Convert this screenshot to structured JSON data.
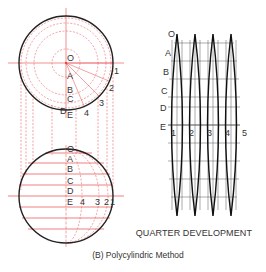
{
  "figure": {
    "caption": "(B) Polycylindric Method",
    "development_caption": "QUARTER DEVELOPMENT",
    "colors": {
      "outline": "#222222",
      "construction": "#e8474a",
      "label": "#333333",
      "background": "#ffffff"
    }
  },
  "top_view": {
    "center_label": "O",
    "latitude_labels": [
      "A",
      "B",
      "C",
      "D",
      "E"
    ],
    "meridian_labels": [
      "1",
      "2",
      "3",
      "4"
    ]
  },
  "front_view": {
    "latitude_labels": [
      "O",
      "A",
      "B",
      "C",
      "D",
      "E"
    ],
    "meridian_labels": [
      "4",
      "3",
      "2",
      "1"
    ]
  },
  "development": {
    "latitude_labels": [
      "O",
      "A",
      "B",
      "C",
      "D",
      "E"
    ],
    "meridian_labels": [
      "1",
      "2",
      "3",
      "4",
      "5"
    ],
    "gore_count": 4
  }
}
